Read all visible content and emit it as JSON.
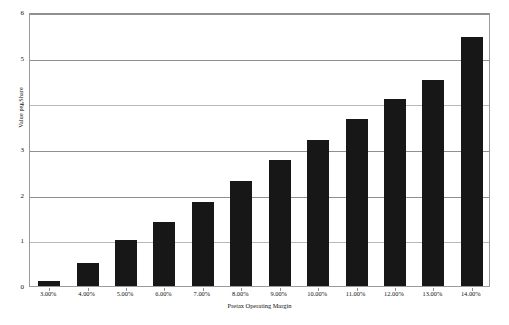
{
  "chart_data": {
    "type": "bar",
    "title": "",
    "xlabel": "Pretax Operating Margin",
    "ylabel": "Value per Share",
    "categories": [
      "3.00%",
      "4.00%",
      "5.00%",
      "6.00%",
      "7.00%",
      "8.00%",
      "9.00%",
      "10.00%",
      "11.00%",
      "12.00%",
      "13.00%",
      "14.00%"
    ],
    "values": [
      0.1,
      0.5,
      1.0,
      1.4,
      1.85,
      2.3,
      2.75,
      3.2,
      3.65,
      4.1,
      4.52,
      5.45
    ],
    "ylim": [
      0,
      6
    ],
    "y_ticks": [
      0,
      1,
      2,
      3,
      4,
      5,
      6
    ],
    "y_tick_labels": [
      "0",
      "1",
      "2",
      "3",
      "4",
      "5",
      "6"
    ],
    "grid": true,
    "legend": "none",
    "bar_color": "#171717",
    "grid_color": "#8f8f8f",
    "plot_border_color": "#9a9a9a",
    "background_color": "#ffffff"
  }
}
